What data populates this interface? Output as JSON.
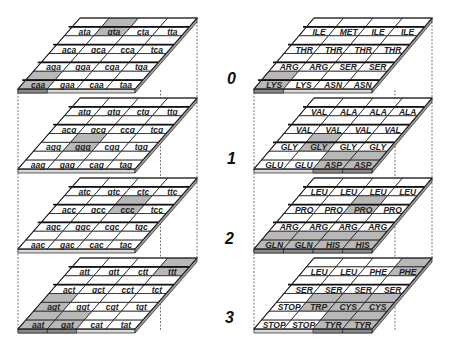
{
  "colors": {
    "highlight": "#b8b8b8",
    "cell": "#ffffff",
    "line": "#222222",
    "edge_dark": "#555555"
  },
  "layer_labels": [
    "0",
    "1",
    "2",
    "3"
  ],
  "codon_stack": {
    "layers": [
      {
        "rows": [
          {
            "cells": [
              "ata",
              "gta",
              "cta",
              "tta"
            ],
            "highlight": [
              false,
              true,
              false,
              false
            ],
            "strike": true
          },
          {
            "cells": [
              "aca",
              "gca",
              "cca",
              "tca"
            ],
            "highlight": [
              false,
              false,
              false,
              false
            ],
            "strike": true
          },
          {
            "cells": [
              "aga",
              "gga",
              "cga",
              "tga"
            ],
            "highlight": [
              false,
              false,
              false,
              false
            ],
            "strike": true
          },
          {
            "cells": [
              "caa",
              "gaa",
              "caa",
              "taa"
            ],
            "highlight": [
              true,
              false,
              false,
              false
            ],
            "strike": true
          }
        ]
      },
      {
        "rows": [
          {
            "cells": [
              "atg",
              "gtg",
              "ctg",
              "ttg"
            ],
            "highlight": [
              false,
              false,
              false,
              false
            ],
            "strike": true
          },
          {
            "cells": [
              "acg",
              "gcg",
              "ccg",
              "tcg"
            ],
            "highlight": [
              false,
              false,
              false,
              false
            ],
            "strike": true
          },
          {
            "cells": [
              "agg",
              "ggg",
              "cgg",
              "tgg"
            ],
            "highlight": [
              false,
              true,
              false,
              false
            ],
            "strike": false
          },
          {
            "cells": [
              "aag",
              "gag",
              "cag",
              "tag"
            ],
            "highlight": [
              false,
              false,
              false,
              false
            ],
            "strike": false
          }
        ]
      },
      {
        "rows": [
          {
            "cells": [
              "atc",
              "gtc",
              "ctc",
              "ttc"
            ],
            "highlight": [
              false,
              false,
              false,
              false
            ],
            "strike": true
          },
          {
            "cells": [
              "acc",
              "gcc",
              "ccc",
              "tcc"
            ],
            "highlight": [
              false,
              false,
              true,
              false
            ],
            "strike": true
          },
          {
            "cells": [
              "agc",
              "ggc",
              "cgc",
              "tgc"
            ],
            "highlight": [
              false,
              false,
              false,
              false
            ],
            "strike": true
          },
          {
            "cells": [
              "aac",
              "gac",
              "cac",
              "tac"
            ],
            "highlight": [
              false,
              false,
              false,
              false
            ],
            "strike": false
          }
        ]
      },
      {
        "rows": [
          {
            "cells": [
              "att",
              "gtt",
              "ctt",
              "ttt"
            ],
            "highlight": [
              false,
              false,
              false,
              true
            ],
            "strike": true
          },
          {
            "cells": [
              "act",
              "gct",
              "cct",
              "tct"
            ],
            "highlight": [
              false,
              false,
              false,
              false
            ],
            "strike": true
          },
          {
            "cells": [
              "agt",
              "ggt",
              "cgt",
              "tgt"
            ],
            "highlight": [
              true,
              false,
              false,
              false
            ],
            "strike": false
          },
          {
            "cells": [
              "aat",
              "gat",
              "cat",
              "tat"
            ],
            "highlight": [
              true,
              true,
              false,
              false
            ],
            "strike": false
          }
        ]
      }
    ]
  },
  "amino_stack": {
    "layers": [
      {
        "rows": [
          {
            "cells": [
              "ILE",
              "MET",
              "ILE",
              "ILE"
            ],
            "sub": [
              "",
              "START",
              "",
              ""
            ],
            "highlight": [
              false,
              false,
              false,
              false
            ],
            "strike": true
          },
          {
            "cells": [
              "THR",
              "THR",
              "THR",
              "THR"
            ],
            "highlight": [
              false,
              false,
              false,
              false
            ],
            "strike": true
          },
          {
            "cells": [
              "ARG",
              "ARG",
              "SER",
              "SER"
            ],
            "highlight": [
              false,
              false,
              false,
              false
            ],
            "strike": true
          },
          {
            "cells": [
              "LYS",
              "LYS",
              "ASN",
              "ASN"
            ],
            "highlight": [
              true,
              false,
              false,
              false
            ],
            "strike": true
          }
        ]
      },
      {
        "rows": [
          {
            "cells": [
              "VAL",
              "ALA",
              "ALA",
              "ALA"
            ],
            "highlight": [
              false,
              false,
              false,
              false
            ],
            "strike": true
          },
          {
            "cells": [
              "VAL",
              "VAL",
              "VAL",
              "VAL"
            ],
            "highlight": [
              false,
              false,
              false,
              false
            ],
            "strike": true
          },
          {
            "cells": [
              "GLY",
              "GLY",
              "GLY",
              "GLY"
            ],
            "highlight": [
              false,
              true,
              false,
              false
            ],
            "strike": true
          },
          {
            "cells": [
              "GLU",
              "GLU",
              "ASP",
              "ASP"
            ],
            "highlight": [
              false,
              false,
              true,
              true
            ],
            "strike": false
          }
        ]
      },
      {
        "rows": [
          {
            "cells": [
              "LEU",
              "LEU",
              "LEU",
              "LEU"
            ],
            "highlight": [
              false,
              false,
              false,
              false
            ],
            "strike": true
          },
          {
            "cells": [
              "PRO",
              "PRO",
              "PRO",
              "PRO"
            ],
            "highlight": [
              false,
              false,
              true,
              false
            ],
            "strike": true
          },
          {
            "cells": [
              "ARG",
              "ARG",
              "ARG",
              "ARG"
            ],
            "highlight": [
              false,
              false,
              false,
              false
            ],
            "strike": true
          },
          {
            "cells": [
              "GLN",
              "GLN",
              "HIS",
              "HIS"
            ],
            "highlight": [
              true,
              true,
              true,
              true
            ],
            "strike": false
          }
        ]
      },
      {
        "rows": [
          {
            "cells": [
              "LEU",
              "LEU",
              "PHE",
              "PHE"
            ],
            "highlight": [
              false,
              false,
              false,
              true
            ],
            "strike": false
          },
          {
            "cells": [
              "SER",
              "SER",
              "SER",
              "SER"
            ],
            "highlight": [
              false,
              false,
              false,
              false
            ],
            "strike": true
          },
          {
            "cells": [
              "STOP",
              "TRP",
              "CYS",
              "CYS"
            ],
            "highlight": [
              false,
              true,
              true,
              true
            ],
            "strike": false
          },
          {
            "cells": [
              "STOP",
              "STOP",
              "TYR",
              "TYR"
            ],
            "highlight": [
              false,
              false,
              true,
              true
            ],
            "strike": false
          }
        ]
      }
    ]
  }
}
